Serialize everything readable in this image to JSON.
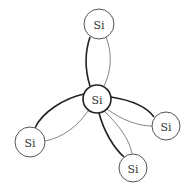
{
  "diagram": {
    "atoms": [
      {
        "id": "center",
        "label": "Si",
        "cx": 97,
        "cy": 99,
        "r": 14
      },
      {
        "id": "top",
        "label": "Si",
        "cx": 99,
        "cy": 24,
        "r": 15
      },
      {
        "id": "left",
        "label": "Si",
        "cx": 30,
        "cy": 142,
        "r": 15
      },
      {
        "id": "right",
        "label": "Si",
        "cx": 166,
        "cy": 126,
        "r": 14
      },
      {
        "id": "bottom",
        "label": "Si",
        "cx": 133,
        "cy": 168,
        "r": 14
      }
    ],
    "bonds": [
      {
        "to": "top",
        "thick": "M90,86 C85,70 85,52 90,37",
        "thin": "M104,86 C112,70 112,52 106,37"
      },
      {
        "to": "left",
        "thick": "M84,94 C65,98 42,112 35,128",
        "thin": "M88,111 C78,126 62,138 45,141"
      },
      {
        "to": "right",
        "thick": "M111,97 C130,100 146,106 154,117",
        "thin": "M107,109 C122,120 138,126 152,126"
      },
      {
        "to": "bottom",
        "thick": "M99,113 C104,132 114,148 124,157",
        "thin": "M104,111 C118,124 130,140 132,154"
      }
    ],
    "colors": {
      "thick_stroke": "#222222",
      "thin_stroke": "#666666",
      "circle_stroke": "#555555",
      "background": "#ffffff"
    }
  }
}
